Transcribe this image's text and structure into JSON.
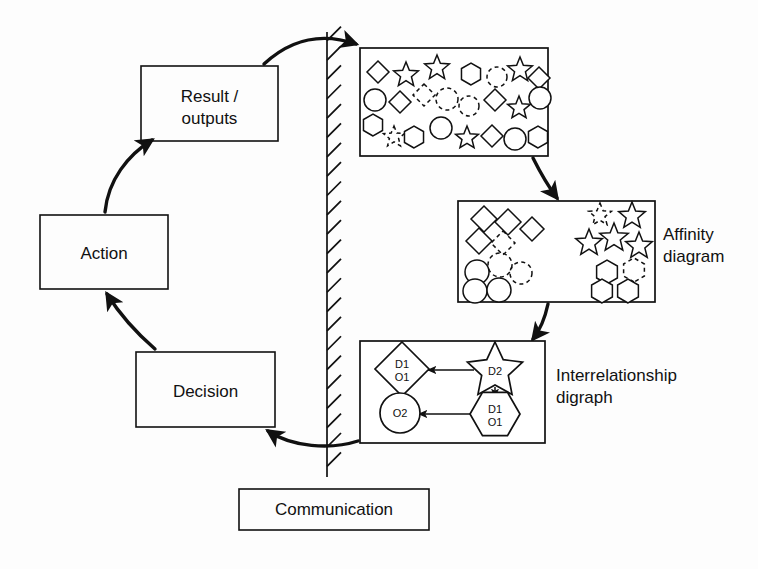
{
  "diagram": {
    "background_color": "#fdfdfd",
    "line_color": "#111111",
    "fill_color": "#ffffff"
  },
  "cycle_boxes": [
    {
      "id": "result",
      "label_line1": "Result /",
      "label_line2": "outputs",
      "x": 141,
      "y": 66,
      "w": 137,
      "h": 75
    },
    {
      "id": "action",
      "label_line1": "Action",
      "label_line2": "",
      "x": 40,
      "y": 215,
      "w": 128,
      "h": 74
    },
    {
      "id": "decision",
      "label_line1": "Decision",
      "label_line2": "",
      "x": 136,
      "y": 352,
      "w": 139,
      "h": 75
    }
  ],
  "communication_box": {
    "label": "Communication",
    "x": 239,
    "y": 489,
    "w": 190,
    "h": 41
  },
  "divider": {
    "name": "hatched-boundary-line",
    "x": 327,
    "y_top": 32,
    "y_bottom": 477,
    "hatch_count": 23,
    "hatch_length": 14
  },
  "panels": [
    {
      "id": "raw-ideas",
      "caption": "",
      "x": 360,
      "y": 48,
      "w": 188,
      "h": 108,
      "description": "Unsorted mixture of diamonds, stars, circles and hexagons"
    },
    {
      "id": "affinity-diagram",
      "caption": "Affinity diagram",
      "caption_line1": "Affinity",
      "caption_line2": "diagram",
      "caption_x": 663,
      "caption_y": 240,
      "x": 458,
      "y": 201,
      "w": 197,
      "h": 101,
      "description": "Shapes grouped into like clusters: diamonds, circles, stars, hexagons"
    },
    {
      "id": "interrelationship-digraph",
      "caption": "Interrelationship digraph",
      "caption_line1": "Interrelationship",
      "caption_line2": "digraph",
      "caption_x": 556,
      "caption_y": 381,
      "x": 360,
      "y": 341,
      "w": 185,
      "h": 102,
      "description": "Four nodes connected by directed arrows showing drivers and outcomes"
    }
  ],
  "digraph_nodes": [
    {
      "id": "diamond-node",
      "shape": "diamond",
      "line1": "D1",
      "line2": "O1",
      "cx": 402,
      "cy": 369
    },
    {
      "id": "star-node",
      "shape": "star",
      "line1": "D2",
      "line2": "",
      "cx": 495,
      "cy": 371
    },
    {
      "id": "circle-node",
      "shape": "circle",
      "line1": "O2",
      "line2": "",
      "cx": 400,
      "cy": 413
    },
    {
      "id": "hexagon-node",
      "shape": "hexagon",
      "line1": "D1",
      "line2": "O1",
      "cx": 495,
      "cy": 414
    }
  ],
  "digraph_edges": [
    {
      "from": "star-node",
      "to": "diamond-node",
      "direction": "left"
    },
    {
      "from": "star-node",
      "to": "hexagon-node",
      "direction": "down"
    },
    {
      "from": "diamond-node",
      "to": "circle-node",
      "direction": "down"
    },
    {
      "from": "hexagon-node",
      "to": "circle-node",
      "direction": "left"
    }
  ],
  "flow_arrows": [
    {
      "id": "action-to-result",
      "from": "action",
      "to": "result"
    },
    {
      "id": "result-to-raw-ideas",
      "from": "result",
      "to": "raw-ideas"
    },
    {
      "id": "raw-ideas-to-affinity",
      "from": "raw-ideas",
      "to": "affinity-diagram"
    },
    {
      "id": "affinity-to-digraph",
      "from": "affinity-diagram",
      "to": "interrelationship-digraph"
    },
    {
      "id": "digraph-to-decision",
      "from": "interrelationship-digraph",
      "to": "decision"
    },
    {
      "id": "decision-to-action",
      "from": "decision",
      "to": "action"
    }
  ],
  "panel1_shapes": [
    {
      "t": "diamond",
      "x": 378,
      "y": 72,
      "s": 11,
      "d": false
    },
    {
      "t": "star",
      "x": 406,
      "y": 75,
      "s": 12,
      "d": false
    },
    {
      "t": "star",
      "x": 437,
      "y": 68,
      "s": 12,
      "d": false
    },
    {
      "t": "hexagon",
      "x": 471,
      "y": 74,
      "s": 11,
      "d": false
    },
    {
      "t": "circle",
      "x": 497,
      "y": 77,
      "s": 10,
      "d": true
    },
    {
      "t": "star",
      "x": 520,
      "y": 70,
      "s": 12,
      "d": false
    },
    {
      "t": "diamond",
      "x": 539,
      "y": 78,
      "s": 11,
      "d": false
    },
    {
      "t": "circle",
      "x": 375,
      "y": 100,
      "s": 11,
      "d": false
    },
    {
      "t": "diamond",
      "x": 400,
      "y": 102,
      "s": 11,
      "d": false
    },
    {
      "t": "diamond",
      "x": 424,
      "y": 95,
      "s": 11,
      "d": true
    },
    {
      "t": "circle",
      "x": 447,
      "y": 99,
      "s": 11,
      "d": true
    },
    {
      "t": "circle",
      "x": 469,
      "y": 106,
      "s": 10,
      "d": true
    },
    {
      "t": "diamond",
      "x": 495,
      "y": 100,
      "s": 11,
      "d": false
    },
    {
      "t": "star",
      "x": 519,
      "y": 108,
      "s": 11,
      "d": false
    },
    {
      "t": "circle",
      "x": 540,
      "y": 98,
      "s": 11,
      "d": false
    },
    {
      "t": "hexagon",
      "x": 373,
      "y": 125,
      "s": 11,
      "d": false
    },
    {
      "t": "star",
      "x": 394,
      "y": 137,
      "s": 10,
      "d": true
    },
    {
      "t": "hexagon",
      "x": 414,
      "y": 137,
      "s": 11,
      "d": false
    },
    {
      "t": "circle",
      "x": 441,
      "y": 128,
      "s": 11,
      "d": false
    },
    {
      "t": "star",
      "x": 467,
      "y": 138,
      "s": 11,
      "d": false
    },
    {
      "t": "diamond",
      "x": 492,
      "y": 136,
      "s": 11,
      "d": false
    },
    {
      "t": "circle",
      "x": 515,
      "y": 139,
      "s": 11,
      "d": false
    },
    {
      "t": "hexagon",
      "x": 538,
      "y": 137,
      "s": 11,
      "d": false
    }
  ],
  "panel2_shapes": [
    {
      "t": "diamond",
      "x": 484,
      "y": 219,
      "s": 13,
      "d": false
    },
    {
      "t": "diamond",
      "x": 508,
      "y": 222,
      "s": 13,
      "d": false
    },
    {
      "t": "diamond",
      "x": 532,
      "y": 229,
      "s": 12,
      "d": false
    },
    {
      "t": "diamond",
      "x": 479,
      "y": 241,
      "s": 13,
      "d": false
    },
    {
      "t": "diamond",
      "x": 503,
      "y": 243,
      "s": 12,
      "d": true
    },
    {
      "t": "circle",
      "x": 477,
      "y": 272,
      "s": 12,
      "d": false
    },
    {
      "t": "circle",
      "x": 500,
      "y": 265,
      "s": 12,
      "d": true
    },
    {
      "t": "circle",
      "x": 521,
      "y": 273,
      "s": 11,
      "d": true
    },
    {
      "t": "circle",
      "x": 475,
      "y": 291,
      "s": 12,
      "d": false
    },
    {
      "t": "circle",
      "x": 499,
      "y": 290,
      "s": 12,
      "d": false
    },
    {
      "t": "star",
      "x": 600,
      "y": 215,
      "s": 11,
      "d": true
    },
    {
      "t": "star",
      "x": 632,
      "y": 216,
      "s": 13,
      "d": false
    },
    {
      "t": "star",
      "x": 589,
      "y": 243,
      "s": 13,
      "d": false
    },
    {
      "t": "star",
      "x": 614,
      "y": 238,
      "s": 14,
      "d": false
    },
    {
      "t": "star",
      "x": 639,
      "y": 246,
      "s": 13,
      "d": false
    },
    {
      "t": "hexagon",
      "x": 607,
      "y": 272,
      "s": 12,
      "d": false
    },
    {
      "t": "hexagon",
      "x": 634,
      "y": 270,
      "s": 12,
      "d": true
    },
    {
      "t": "hexagon",
      "x": 602,
      "y": 291,
      "s": 12,
      "d": false
    },
    {
      "t": "hexagon",
      "x": 628,
      "y": 291,
      "s": 12,
      "d": false
    }
  ]
}
